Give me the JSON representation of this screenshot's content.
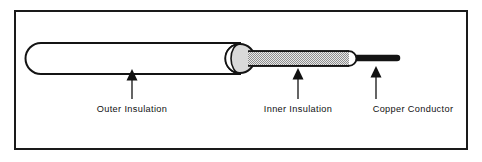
{
  "figure": {
    "background_color": "#ffffff",
    "frame": {
      "name": "outer-border",
      "stroke_color": "#1a1a1a",
      "fill_color": "#ffffff",
      "x": 14,
      "y": 10,
      "width": 454,
      "height": 140,
      "stroke_width": 2
    }
  },
  "cable": {
    "outer_insulation": {
      "label": "Outer Insulation",
      "fill_color": "#ffffff",
      "stroke_color": "#141414",
      "stroke_width": 2,
      "x": 26,
      "y": 44,
      "width": 215,
      "height": 29,
      "end_cap": "rounded"
    },
    "outer_end_cap": {
      "label": "Outer insulation cut end",
      "fill_color": "#d7d7d7",
      "stroke_color": "#141414",
      "center_x": 240,
      "center_y": 58.5,
      "radius": 14.5
    },
    "inner_insulation": {
      "label": "Inner Insulation",
      "fill_color": "#c9c9c9",
      "pattern": "fine-checkerboard",
      "stroke_color": "#141414",
      "stroke_width": 1.6,
      "x": 248,
      "y": 51,
      "width": 100,
      "height": 15,
      "end_cap": "rounded"
    },
    "inner_end_cap": {
      "label": "Inner insulation cut end",
      "fill_color": "#ffffff",
      "stroke_color": "#141414",
      "center_x": 349,
      "center_y": 58.5,
      "radius": 7.5
    },
    "copper_conductor": {
      "label": "Copper Conductor",
      "fill_color": "#141414",
      "x": 352,
      "y": 55,
      "width": 47,
      "height": 6,
      "end_cap": "rounded"
    }
  },
  "callouts": [
    {
      "name": "callout-outer-insulation",
      "text": "Outer Insulation",
      "text_x": 132,
      "text_y": 112,
      "text_anchor": "middle",
      "arrow_x": 132,
      "arrow_tip_y": 70,
      "arrow_tail_y": 99,
      "arrow_color": "#111111"
    },
    {
      "name": "callout-inner-insulation",
      "text": "Inner Insulation",
      "text_x": 298,
      "text_y": 112,
      "text_anchor": "middle",
      "arrow_x": 298,
      "arrow_tip_y": 68,
      "arrow_tail_y": 99,
      "arrow_color": "#111111"
    },
    {
      "name": "callout-copper-conductor",
      "text": "Copper Conductor",
      "text_x": 413,
      "text_y": 112,
      "text_anchor": "middle",
      "arrow_x": 376,
      "arrow_tip_y": 66,
      "arrow_tail_y": 99,
      "arrow_color": "#111111"
    }
  ]
}
